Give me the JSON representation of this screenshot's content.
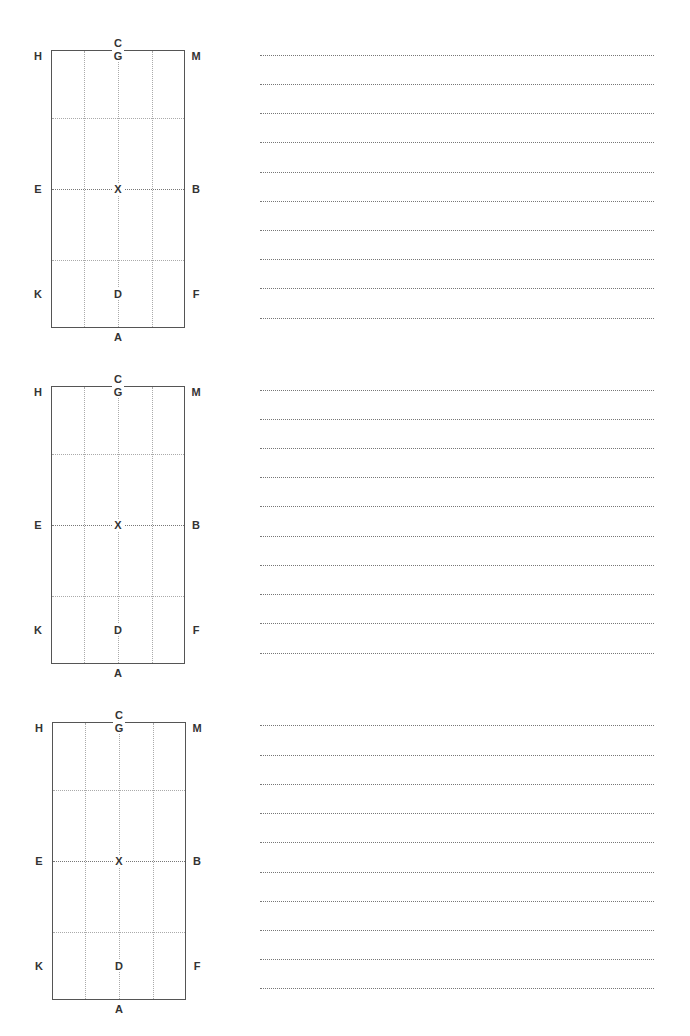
{
  "worksheet": {
    "arenas": [
      {
        "letters": {
          "top": "C",
          "bottom": "A",
          "left_top": "H",
          "left_mid": "E",
          "left_bottom": "K",
          "right_top": "M",
          "right_mid": "B",
          "right_bottom": "F",
          "center_top": "G",
          "center_mid": "X",
          "center_bottom": "D"
        },
        "writing_lines": 10
      },
      {
        "letters": {
          "top": "C",
          "bottom": "A",
          "left_top": "H",
          "left_mid": "E",
          "left_bottom": "K",
          "right_top": "M",
          "right_mid": "B",
          "right_bottom": "F",
          "center_top": "G",
          "center_mid": "X",
          "center_bottom": "D"
        },
        "writing_lines": 10
      },
      {
        "letters": {
          "top": "C",
          "bottom": "A",
          "left_top": "H",
          "left_mid": "E",
          "left_bottom": "K",
          "right_top": "M",
          "right_mid": "B",
          "right_bottom": "F",
          "center_top": "G",
          "center_mid": "X",
          "center_bottom": "D"
        },
        "writing_lines": 10
      }
    ]
  }
}
